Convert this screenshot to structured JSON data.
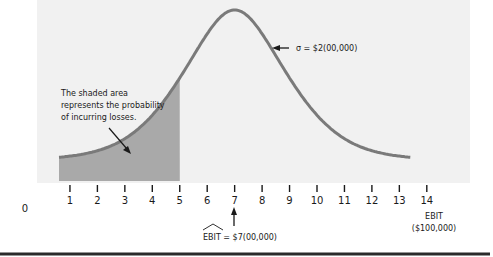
{
  "chart_data": {
    "type": "area",
    "title": "",
    "xlabel": "EBIT\n($100,000)",
    "xlabel_lines": [
      "EBIT",
      "($100,000)"
    ],
    "ylabel": "",
    "xlim": [
      0,
      14
    ],
    "x_ticks": [
      1,
      2,
      3,
      4,
      5,
      6,
      7,
      8,
      9,
      10,
      11,
      12,
      13,
      14
    ],
    "x_tick_labels": [
      "1",
      "2",
      "3",
      "4",
      "5",
      "6",
      "7",
      "8",
      "9",
      "10",
      "11",
      "12",
      "13",
      "14"
    ],
    "origin_label": "0",
    "distribution": {
      "mean": 7,
      "sigma": 2,
      "x_start": 0.6,
      "x_end": 13.4
    },
    "shaded_region": {
      "from": 0.6,
      "to": 5
    },
    "grid": false,
    "legend": "none",
    "annotations": {
      "sigma": "σ = $2(00,000)",
      "shaded_note": [
        "The shaded area",
        "represents the probability",
        "of incurring losses."
      ],
      "mean_label": "EBIT = $7(00,000)",
      "mean_label_hat": "EBIT"
    },
    "colors": {
      "panel": "#f1f1f1",
      "curve": "#7a7a7a",
      "shade": "#a9a9a9",
      "text": "#1a1a1a",
      "rule": "#2a2a2a"
    }
  }
}
